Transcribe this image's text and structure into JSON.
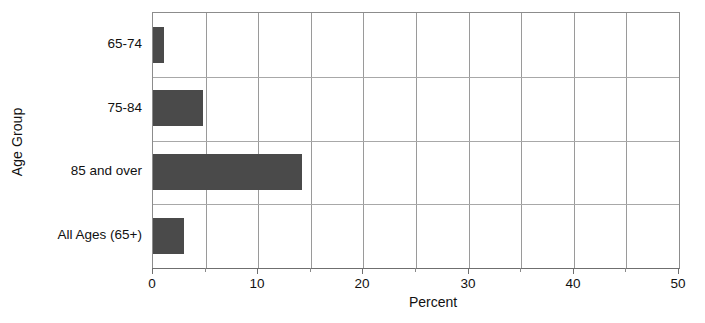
{
  "chart_data": {
    "type": "bar",
    "orientation": "horizontal",
    "title": "",
    "xlabel": "Percent",
    "ylabel": "Age Group",
    "categories": [
      "65-74",
      "75-84",
      "85 and over",
      "All Ages (65+)"
    ],
    "values": [
      1.0,
      4.8,
      14.2,
      2.9
    ],
    "xlim": [
      0,
      50
    ],
    "xticks": [
      0,
      10,
      20,
      30,
      40,
      50
    ],
    "xtick_labels": [
      "0",
      "10",
      "20",
      "30",
      "40",
      "50"
    ],
    "minor_xticks": [
      5,
      15,
      25,
      35,
      45
    ],
    "gridlines": {
      "vertical": [
        5,
        10,
        15,
        20,
        25,
        30,
        35,
        40,
        45
      ],
      "horizontal": true
    },
    "bar_color": "#4a4a4a",
    "grid_color": "#9a9a9a",
    "axis_color": "#6f6f6f",
    "background": "#ffffff",
    "legend": null
  }
}
